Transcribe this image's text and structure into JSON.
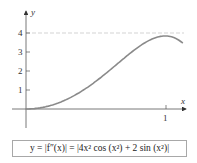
{
  "chart_data": {
    "type": "line",
    "title": "",
    "xlabel": "x",
    "ylabel": "y",
    "x_ticks": [
      "1"
    ],
    "y_ticks": [
      "1",
      "2",
      "3",
      "4"
    ],
    "xlim": [
      0,
      1.12
    ],
    "ylim": [
      0,
      4.5
    ],
    "reference_line": {
      "y": 4,
      "style": "dashed"
    },
    "series": [
      {
        "name": "y = |f''(x)|",
        "x": [
          0,
          0.1,
          0.2,
          0.3,
          0.4,
          0.5,
          0.6,
          0.7,
          0.8,
          0.9,
          1.0,
          1.05,
          1.1,
          1.12
        ],
        "values": [
          0,
          0.06,
          0.24,
          0.54,
          0.95,
          1.46,
          2.04,
          2.64,
          3.22,
          3.66,
          3.84,
          3.81,
          3.72,
          3.66
        ]
      }
    ],
    "grid": false,
    "legend": "none"
  },
  "formula": {
    "lhs": "y = |f″(x)| = |4x² cos (x²) + 2 sin (x²)|"
  },
  "axes": {
    "x_label": "x",
    "y_label": "y",
    "x_tick_1": "1",
    "y_tick_1": "1",
    "y_tick_2": "2",
    "y_tick_3": "3",
    "y_tick_4": "4"
  },
  "colors": {
    "curve": "#8a8a8a",
    "axis": "#555555",
    "dashed": "#c8c8c8"
  }
}
